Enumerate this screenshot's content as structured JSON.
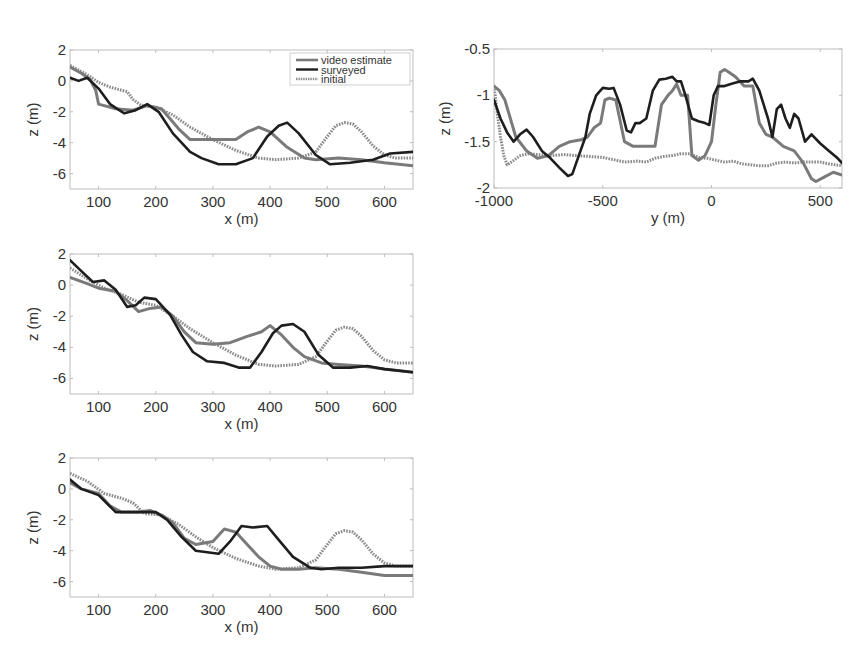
{
  "figure": {
    "colors": {
      "video_estimate": "#7a7a7a",
      "surveyed": "#1e1e1e",
      "initial": "#8a8a8a",
      "frame": "#bdbdbd",
      "text": "#333333"
    }
  },
  "chart_data": [
    {
      "type": "line",
      "id": "panel-a",
      "title": "",
      "xlabel": "x (m)",
      "ylabel": "z (m)",
      "xlim": [
        50,
        650
      ],
      "ylim": [
        -7,
        2
      ],
      "xticks": [
        100,
        200,
        300,
        400,
        500,
        600
      ],
      "yticks": [
        2,
        0,
        -2,
        -4,
        -6
      ],
      "grid": false,
      "legend": {
        "position": "upper right",
        "entries": [
          "video estimate",
          "surveyed",
          "initial"
        ]
      },
      "series": [
        {
          "name": "video estimate",
          "style": "solid-gray",
          "x": [
            50,
            70,
            85,
            95,
            100,
            130,
            160,
            185,
            210,
            240,
            260,
            300,
            340,
            360,
            380,
            400,
            430,
            460,
            480,
            520,
            560,
            600,
            650
          ],
          "y": [
            0.9,
            0.5,
            0.1,
            -0.6,
            -1.5,
            -1.8,
            -1.9,
            -1.6,
            -1.8,
            -3.1,
            -3.8,
            -3.8,
            -3.8,
            -3.3,
            -3.0,
            -3.3,
            -4.3,
            -5.0,
            -5.1,
            -5.0,
            -5.1,
            -5.3,
            -5.5
          ]
        },
        {
          "name": "surveyed",
          "style": "solid-black",
          "x": [
            50,
            65,
            80,
            100,
            120,
            145,
            165,
            185,
            205,
            230,
            260,
            280,
            310,
            340,
            370,
            395,
            415,
            430,
            450,
            480,
            505,
            540,
            580,
            610,
            650
          ],
          "y": [
            0.2,
            0.0,
            0.2,
            -0.5,
            -1.5,
            -2.1,
            -1.9,
            -1.5,
            -2.0,
            -3.4,
            -4.6,
            -5.0,
            -5.4,
            -5.4,
            -5.0,
            -3.6,
            -2.9,
            -2.7,
            -3.4,
            -4.8,
            -5.4,
            -5.3,
            -5.1,
            -4.7,
            -4.6
          ]
        },
        {
          "name": "initial",
          "style": "dotted-gray",
          "x": [
            50,
            80,
            100,
            120,
            140,
            150,
            160,
            175,
            200,
            230,
            260,
            300,
            340,
            380,
            410,
            450,
            480,
            500,
            515,
            530,
            545,
            560,
            580,
            600,
            620,
            650
          ],
          "y": [
            1.0,
            0.4,
            -0.1,
            -0.4,
            -0.6,
            -0.7,
            -1.2,
            -1.6,
            -1.7,
            -2.2,
            -3.0,
            -3.8,
            -4.5,
            -5.0,
            -5.1,
            -5.0,
            -4.6,
            -3.6,
            -2.9,
            -2.7,
            -2.8,
            -3.3,
            -4.2,
            -4.8,
            -5.0,
            -5.0
          ]
        }
      ]
    },
    {
      "type": "line",
      "id": "panel-b",
      "title": "",
      "xlabel": "y (m)",
      "ylabel": "z (m)",
      "xlim": [
        -1000,
        600
      ],
      "ylim": [
        -2,
        -0.5
      ],
      "xticks": [
        -1000,
        -500,
        0,
        500
      ],
      "yticks": [
        -0.5,
        -1,
        -1.5,
        -2
      ],
      "grid": false,
      "series": [
        {
          "name": "video estimate",
          "style": "solid-gray",
          "x": [
            -1000,
            -975,
            -950,
            -900,
            -850,
            -800,
            -750,
            -700,
            -650,
            -600,
            -570,
            -540,
            -510,
            -490,
            -470,
            -440,
            -400,
            -360,
            -320,
            -290,
            -260,
            -230,
            -200,
            -180,
            -160,
            -140,
            -110,
            -90,
            -60,
            -30,
            0,
            20,
            40,
            60,
            80,
            110,
            150,
            190,
            220,
            250,
            280,
            330,
            380,
            420,
            460,
            480,
            520,
            560,
            600
          ],
          "y": [
            -0.9,
            -0.95,
            -1.05,
            -1.45,
            -1.6,
            -1.68,
            -1.65,
            -1.55,
            -1.5,
            -1.48,
            -1.45,
            -1.35,
            -1.3,
            -1.05,
            -1.03,
            -1.05,
            -1.5,
            -1.55,
            -1.55,
            -1.55,
            -1.55,
            -1.1,
            -1.0,
            -0.95,
            -0.88,
            -1.0,
            -1.0,
            -1.65,
            -1.7,
            -1.65,
            -1.5,
            -1.1,
            -0.75,
            -0.72,
            -0.75,
            -0.8,
            -0.9,
            -0.9,
            -1.3,
            -1.42,
            -1.45,
            -1.55,
            -1.6,
            -1.72,
            -1.9,
            -1.93,
            -1.88,
            -1.83,
            -1.86
          ]
        },
        {
          "name": "surveyed",
          "style": "solid-black",
          "x": [
            -1000,
            -970,
            -940,
            -910,
            -880,
            -850,
            -820,
            -780,
            -740,
            -700,
            -660,
            -640,
            -610,
            -580,
            -560,
            -530,
            -500,
            -470,
            -450,
            -420,
            -390,
            -370,
            -350,
            -330,
            -300,
            -270,
            -240,
            -210,
            -180,
            -160,
            -140,
            -120,
            -90,
            -60,
            -30,
            -10,
            10,
            30,
            60,
            100,
            130,
            170,
            190,
            220,
            260,
            280,
            300,
            320,
            340,
            360,
            380,
            400,
            430,
            460,
            500,
            540,
            580,
            600
          ],
          "y": [
            -1.05,
            -1.25,
            -1.4,
            -1.5,
            -1.42,
            -1.37,
            -1.45,
            -1.6,
            -1.68,
            -1.78,
            -1.87,
            -1.85,
            -1.65,
            -1.45,
            -1.2,
            -1.0,
            -0.92,
            -0.93,
            -0.92,
            -1.1,
            -1.38,
            -1.4,
            -1.3,
            -1.3,
            -1.25,
            -0.95,
            -0.83,
            -0.82,
            -0.8,
            -0.85,
            -0.85,
            -1.0,
            -1.25,
            -1.28,
            -1.3,
            -1.32,
            -1.0,
            -0.9,
            -0.9,
            -0.87,
            -0.85,
            -0.85,
            -0.82,
            -0.95,
            -1.25,
            -1.45,
            -1.15,
            -1.1,
            -1.25,
            -1.35,
            -1.2,
            -1.25,
            -1.5,
            -1.42,
            -1.52,
            -1.6,
            -1.68,
            -1.73
          ]
        },
        {
          "name": "initial",
          "style": "dotted-gray",
          "x": [
            -1000,
            -985,
            -970,
            -955,
            -940,
            -920,
            -880,
            -840,
            -800,
            -740,
            -680,
            -620,
            -560,
            -500,
            -440,
            -400,
            -340,
            -300,
            -260,
            -220,
            -180,
            -140,
            -100,
            -60,
            -20,
            20,
            60,
            100,
            140,
            180,
            220,
            260,
            300,
            340,
            380,
            420,
            460,
            500,
            540,
            570,
            600
          ],
          "y": [
            -0.9,
            -1.2,
            -1.45,
            -1.65,
            -1.75,
            -1.72,
            -1.65,
            -1.63,
            -1.64,
            -1.65,
            -1.64,
            -1.65,
            -1.66,
            -1.67,
            -1.7,
            -1.72,
            -1.71,
            -1.72,
            -1.68,
            -1.66,
            -1.65,
            -1.63,
            -1.63,
            -1.67,
            -1.68,
            -1.7,
            -1.72,
            -1.71,
            -1.74,
            -1.75,
            -1.76,
            -1.76,
            -1.73,
            -1.72,
            -1.73,
            -1.72,
            -1.72,
            -1.72,
            -1.74,
            -1.75,
            -1.76
          ]
        }
      ]
    },
    {
      "type": "line",
      "id": "panel-c",
      "title": "",
      "xlabel": "x (m)",
      "ylabel": "z (m)",
      "xlim": [
        50,
        650
      ],
      "ylim": [
        -7,
        2
      ],
      "xticks": [
        100,
        200,
        300,
        400,
        500,
        600
      ],
      "yticks": [
        2,
        0,
        -2,
        -4,
        -6
      ],
      "grid": false,
      "series": [
        {
          "name": "video estimate",
          "style": "solid-gray",
          "x": [
            50,
            80,
            100,
            130,
            150,
            170,
            190,
            210,
            230,
            250,
            270,
            300,
            330,
            360,
            385,
            400,
            420,
            440,
            460,
            490,
            520,
            560,
            600,
            650
          ],
          "y": [
            0.5,
            0.1,
            -0.2,
            -0.4,
            -1.0,
            -1.7,
            -1.5,
            -1.4,
            -2.0,
            -3.0,
            -3.7,
            -3.8,
            -3.7,
            -3.3,
            -3.0,
            -2.6,
            -3.2,
            -4.0,
            -4.6,
            -5.0,
            -5.1,
            -5.2,
            -5.4,
            -5.6
          ]
        },
        {
          "name": "surveyed",
          "style": "solid-black",
          "x": [
            50,
            70,
            90,
            110,
            130,
            150,
            165,
            180,
            200,
            225,
            245,
            265,
            290,
            320,
            345,
            365,
            385,
            405,
            420,
            440,
            460,
            485,
            510,
            540,
            570,
            600,
            650
          ],
          "y": [
            1.6,
            0.9,
            0.2,
            0.3,
            -0.3,
            -1.4,
            -1.3,
            -0.8,
            -0.9,
            -1.9,
            -3.2,
            -4.3,
            -4.9,
            -5.0,
            -5.3,
            -5.3,
            -4.3,
            -3.1,
            -2.6,
            -2.5,
            -3.0,
            -4.5,
            -5.3,
            -5.3,
            -5.2,
            -5.4,
            -5.6
          ]
        },
        {
          "name": "initial",
          "style": "dotted-gray",
          "x": [
            50,
            80,
            110,
            140,
            170,
            200,
            230,
            260,
            300,
            340,
            380,
            410,
            450,
            480,
            500,
            515,
            530,
            545,
            560,
            580,
            600,
            620,
            650
          ],
          "y": [
            1.1,
            0.4,
            -0.2,
            -0.6,
            -1.1,
            -1.3,
            -2.0,
            -2.8,
            -3.7,
            -4.5,
            -5.1,
            -5.2,
            -5.1,
            -4.6,
            -3.6,
            -2.9,
            -2.7,
            -2.8,
            -3.3,
            -4.2,
            -4.8,
            -5.0,
            -5.0
          ]
        }
      ]
    },
    {
      "type": "line",
      "id": "panel-d",
      "title": "",
      "xlabel": "x (m)",
      "ylabel": "z (m)",
      "xlim": [
        50,
        650
      ],
      "ylim": [
        -7,
        2
      ],
      "xticks": [
        100,
        200,
        300,
        400,
        500,
        600
      ],
      "yticks": [
        2,
        0,
        -2,
        -4,
        -6
      ],
      "grid": false,
      "series": [
        {
          "name": "video estimate",
          "style": "solid-gray",
          "x": [
            50,
            70,
            100,
            120,
            140,
            170,
            190,
            210,
            230,
            250,
            270,
            300,
            320,
            340,
            360,
            380,
            400,
            420,
            450,
            480,
            520,
            560,
            600,
            650
          ],
          "y": [
            0.4,
            0.0,
            -0.3,
            -1.1,
            -1.5,
            -1.5,
            -1.4,
            -1.7,
            -2.2,
            -3.2,
            -3.6,
            -3.4,
            -2.6,
            -2.8,
            -3.6,
            -4.4,
            -5.0,
            -5.2,
            -5.2,
            -5.1,
            -5.2,
            -5.4,
            -5.6,
            -5.6
          ]
        },
        {
          "name": "surveyed",
          "style": "solid-black",
          "x": [
            50,
            70,
            100,
            130,
            150,
            170,
            200,
            220,
            245,
            270,
            290,
            310,
            330,
            350,
            370,
            395,
            415,
            440,
            470,
            490,
            520,
            560,
            600,
            630,
            650
          ],
          "y": [
            0.6,
            0.0,
            -0.4,
            -1.5,
            -1.5,
            -1.5,
            -1.5,
            -2.0,
            -3.1,
            -4.0,
            -4.1,
            -4.2,
            -3.4,
            -2.4,
            -2.5,
            -2.4,
            -3.3,
            -4.4,
            -5.1,
            -5.2,
            -5.1,
            -5.1,
            -5.0,
            -5.0,
            -5.0
          ]
        },
        {
          "name": "initial",
          "style": "dotted-gray",
          "x": [
            50,
            80,
            110,
            140,
            160,
            180,
            210,
            240,
            270,
            300,
            340,
            380,
            410,
            450,
            480,
            500,
            515,
            530,
            545,
            560,
            580,
            600,
            620,
            650
          ],
          "y": [
            1.0,
            0.5,
            -0.3,
            -0.6,
            -0.9,
            -1.6,
            -1.7,
            -2.3,
            -3.1,
            -3.8,
            -4.5,
            -5.0,
            -5.2,
            -5.1,
            -4.6,
            -3.6,
            -2.9,
            -2.7,
            -2.8,
            -3.3,
            -4.2,
            -4.8,
            -5.0,
            -5.0
          ]
        }
      ]
    }
  ]
}
